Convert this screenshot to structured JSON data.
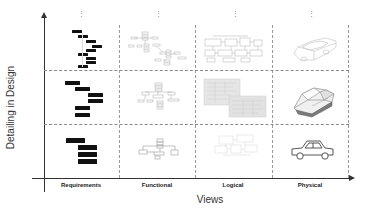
{
  "diagram": {
    "y_axis": {
      "title": "Detailing in Design"
    },
    "x_axis": {
      "title": "Views"
    },
    "columns": [
      {
        "label": "Requirements",
        "more": "⋮"
      },
      {
        "label": "Functional",
        "more": "⋮"
      },
      {
        "label": "Logical",
        "more": "⋮"
      },
      {
        "label": "Physical",
        "more": "⋮"
      }
    ],
    "rows": [
      {
        "level": "high-detail"
      },
      {
        "level": "medium-detail"
      },
      {
        "level": "low-detail"
      }
    ],
    "cells": {
      "requirements": [
        "requirements-bars-detailed",
        "requirements-bars-medium",
        "requirements-bars-simple"
      ],
      "functional": [
        "functional-tree-detailed",
        "functional-tree-medium",
        "functional-tree-simple"
      ],
      "logical": [
        "logical-schematic-detailed",
        "logical-block-diagram",
        "logical-schematic-sketch"
      ],
      "physical": [
        "car-wireframe-icon",
        "car-3d-model-icon",
        "car-outline-icon"
      ]
    },
    "colors": {
      "axis": "#333333",
      "grid": "#9a9a9a",
      "bars": "#111111",
      "faint": "#c8c8c8"
    }
  }
}
